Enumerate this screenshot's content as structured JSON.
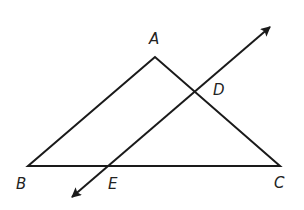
{
  "diagram": {
    "points": {
      "A": {
        "label": "A",
        "x": 155,
        "y": 57
      },
      "B": {
        "label": "B",
        "x": 28,
        "y": 166
      },
      "C": {
        "label": "C",
        "x": 280,
        "y": 166
      },
      "D": {
        "label": "D",
        "x": 195,
        "y": 92
      },
      "E": {
        "label": "E",
        "x": 108,
        "y": 166
      }
    },
    "triangle": [
      "A",
      "B",
      "C"
    ],
    "line": {
      "through": [
        "E",
        "D"
      ],
      "arrows": "both",
      "start": [
        69,
        200
      ],
      "end": [
        273,
        24
      ]
    },
    "stroke_color": "#1a1a1a"
  }
}
